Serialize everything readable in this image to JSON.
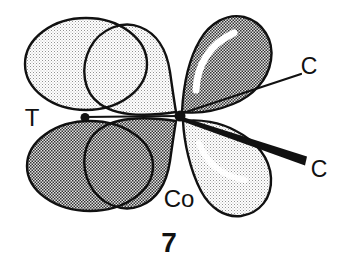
{
  "figure": {
    "number": "7",
    "labels": {
      "trans_ligand": "T",
      "metal_center": "Co",
      "carbonyl_upper": "C",
      "carbonyl_lower": "C"
    },
    "colors": {
      "ink": "#111111",
      "background": "#ffffff",
      "light_halftone_dot": "#949494",
      "light_halftone_bg": "#ffffff",
      "dark_halftone_ink": "#333333",
      "dark_halftone_bg": "#e3e3e3",
      "highlight": "#ffffff"
    }
  }
}
